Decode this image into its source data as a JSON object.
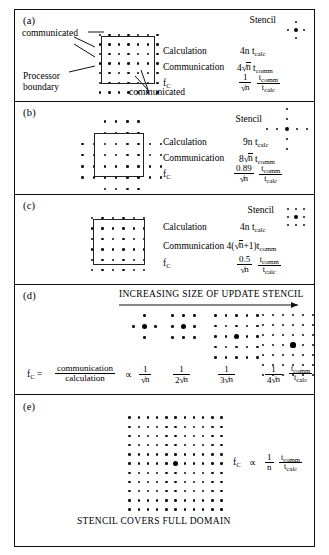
{
  "figure": {
    "panels": [
      {
        "id": "a",
        "label": "(a)",
        "stencil_label": "Stencil",
        "stencil_type": "plus-5point",
        "annotations": {
          "communicated_top": "communicated",
          "processor_boundary": "Processor\nboundary",
          "processor_boundary_line1": "Processor",
          "processor_boundary_line2": "boundary",
          "communicated_bottom": "communicated"
        },
        "rows": [
          {
            "name": "Calculation",
            "expr_plain": "4n t_calc",
            "coef": "4n",
            "unit": "t",
            "unit_sub": "calc"
          },
          {
            "name": "Communication",
            "expr_plain": "4√n t_comm",
            "coef": "4√n",
            "unit": "t",
            "unit_sub": "comm"
          },
          {
            "name": "f_C",
            "expr_plain": "(1/√n)(t_comm/t_calc)",
            "num": "1",
            "den": "√n",
            "num2": "t_comm",
            "den2": "t_calc"
          }
        ],
        "grid": {
          "interior_cols": 5,
          "interior_rows": 5,
          "halo": 1,
          "halo_style": "full-ring"
        }
      },
      {
        "id": "b",
        "label": "(b)",
        "stencil_label": "Stencil",
        "stencil_type": "plus-9point-arm2",
        "rows": [
          {
            "name": "Calculation",
            "coef": "9n",
            "unit": "t",
            "unit_sub": "calc"
          },
          {
            "name": "Communication",
            "coef": "8√n",
            "unit": "t",
            "unit_sub": "comm"
          },
          {
            "name": "f_C",
            "num": "0.89",
            "den": "√n",
            "num2": "t_comm",
            "den2": "t_calc"
          }
        ],
        "grid": {
          "interior_cols": 4,
          "interior_rows": 4,
          "halo": 2,
          "halo_style": "cross"
        }
      },
      {
        "id": "c",
        "label": "(c)",
        "stencil_label": "Stencil",
        "stencil_type": "box-3x3",
        "rows": [
          {
            "name": "Calculation",
            "coef": "4n",
            "unit": "t",
            "unit_sub": "calc"
          },
          {
            "name": "Communication",
            "coef": "4(√n+1)",
            "unit": "t",
            "unit_sub": "comm"
          },
          {
            "name": "f_C",
            "num": "0.5",
            "den": "√n",
            "num2": "t_comm",
            "den2": "t_calc"
          }
        ],
        "grid": {
          "interior_cols": 4,
          "interior_rows": 4,
          "halo": 1,
          "halo_style": "full-ring"
        }
      },
      {
        "id": "d",
        "label": "(d)",
        "heading": "INCREASING SIZE OF UPDATE STENCIL",
        "fc_label": "f",
        "fc_sub": "C",
        "equals": "=",
        "ratio_num": "communication",
        "ratio_den": "calculation",
        "propto": "∝",
        "stencils": [
          {
            "type": "plus-5point",
            "size": 1,
            "value_num": "1",
            "value_den": "√n"
          },
          {
            "type": "box",
            "size": 3,
            "value_num": "1",
            "value_den": "2√n"
          },
          {
            "type": "box",
            "size": 5,
            "value_num": "1",
            "value_den": "3√n"
          },
          {
            "type": "box",
            "size": 7,
            "value_num": "1",
            "value_den": "4√n"
          }
        ],
        "tail_num": "t_comm",
        "tail_den": "t_calc"
      },
      {
        "id": "e",
        "label": "(e)",
        "caption": "STENCIL COVERS FULL DOMAIN",
        "fc_label": "f",
        "fc_sub": "C",
        "propto": "∝",
        "value_num": "1",
        "value_den": "n",
        "tail_num": "t_comm",
        "tail_den": "t_calc",
        "grid": {
          "cols": 11,
          "rows": 11,
          "center_marked": true
        }
      }
    ],
    "glyphs": {
      "t_comm": "t_comm",
      "t_calc": "t_calc",
      "sqrt_n": "√n",
      "proportional": "∝",
      "arrow": "→"
    },
    "colors": {
      "ink": "#111111",
      "paper": "#ffffff",
      "rule": "#222222"
    }
  }
}
